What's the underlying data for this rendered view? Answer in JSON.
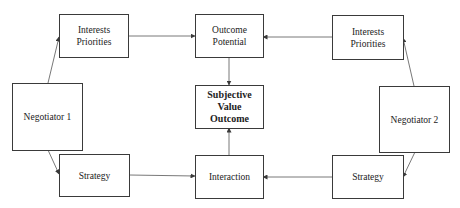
{
  "diagram": {
    "nodes": {
      "interests_left": {
        "lines": [
          "Interests",
          "Priorities"
        ]
      },
      "outcome_potential": {
        "lines": [
          "Outcome",
          "Potential"
        ]
      },
      "interests_right": {
        "lines": [
          "Interests",
          "Priorities"
        ]
      },
      "negotiator_1": {
        "lines": [
          "Negotiator 1"
        ]
      },
      "subjective_value": {
        "lines": [
          "Subjective",
          "Value",
          "Outcome"
        ]
      },
      "negotiator_2": {
        "lines": [
          "Negotiator 2"
        ]
      },
      "strategy_left": {
        "lines": [
          "Strategy"
        ]
      },
      "interaction": {
        "lines": [
          "Interaction"
        ]
      },
      "strategy_right": {
        "lines": [
          "Strategy"
        ]
      }
    },
    "edges": [
      {
        "from": "negotiator_1",
        "to": "interests_left"
      },
      {
        "from": "negotiator_1",
        "to": "strategy_left"
      },
      {
        "from": "interests_left",
        "to": "outcome_potential"
      },
      {
        "from": "interests_right",
        "to": "outcome_potential"
      },
      {
        "from": "negotiator_2",
        "to": "interests_right"
      },
      {
        "from": "negotiator_2",
        "to": "strategy_right"
      },
      {
        "from": "strategy_left",
        "to": "interaction"
      },
      {
        "from": "strategy_right",
        "to": "interaction"
      },
      {
        "from": "outcome_potential",
        "to": "subjective_value"
      },
      {
        "from": "interaction",
        "to": "subjective_value"
      }
    ],
    "colors": {
      "line": "#3a3a3a",
      "background": "#ffffff"
    }
  }
}
